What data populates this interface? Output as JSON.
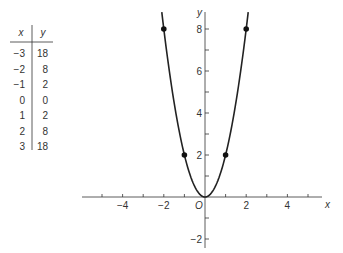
{
  "table": {
    "headers": [
      "x",
      "y"
    ],
    "rows": [
      [
        "−3",
        "18"
      ],
      [
        "−2",
        "8"
      ],
      [
        "−1",
        "2"
      ],
      [
        "0",
        "0"
      ],
      [
        "1",
        "2"
      ],
      [
        "2",
        "8"
      ],
      [
        "3",
        "18"
      ]
    ]
  },
  "chart_data": {
    "type": "line",
    "title": "",
    "function": "y = 2x^2",
    "xlabel": "x",
    "ylabel": "y",
    "origin_label": "O",
    "xlim": [
      -5.3,
      6
    ],
    "ylim": [
      -2.4,
      9
    ],
    "x_ticks": [
      -5,
      -4,
      -3,
      -2,
      -1,
      1,
      2,
      3,
      4,
      5
    ],
    "x_tick_labels": [
      "−4",
      "−2",
      "2",
      "4"
    ],
    "x_tick_label_values": [
      -4,
      -2,
      2,
      4
    ],
    "y_ticks": [
      -2,
      -1,
      1,
      2,
      3,
      4,
      5,
      6,
      7,
      8
    ],
    "y_tick_labels": [
      "−2",
      "2",
      "4",
      "6",
      "8"
    ],
    "y_tick_label_values": [
      -2,
      2,
      4,
      6,
      8
    ],
    "grid": false,
    "legend": null,
    "series": [
      {
        "name": "y = 2x²",
        "x": [
          -2,
          -1,
          0,
          1,
          2
        ],
        "y": [
          8,
          2,
          0,
          2,
          8
        ],
        "markers": [
          [
            -2,
            8
          ],
          [
            -1,
            2
          ],
          [
            1,
            2
          ],
          [
            2,
            8
          ]
        ]
      }
    ]
  }
}
